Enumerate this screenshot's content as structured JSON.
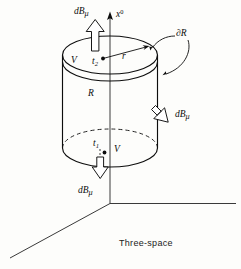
{
  "figure": {
    "caption": "Three-space",
    "background_color": "#fdfdfb",
    "ink_color": "#0d0d0d",
    "width": 241,
    "height": 269,
    "labels": {
      "axis_x0": "x",
      "axis_x0_sup": "0",
      "flux_top": "dB",
      "flux_top_sub": "μ",
      "flux_side": "dB",
      "flux_side_sub": "μ",
      "flux_bottom": "dB",
      "flux_bottom_sub": "μ",
      "boundary": "∂R",
      "region": "R",
      "radius": "r",
      "time_upper": "t",
      "time_upper_sub": "2",
      "time_lower": "t",
      "time_lower_sub": "1",
      "volume_upper": "V",
      "volume_lower": "V",
      "volume_left": "V"
    }
  }
}
